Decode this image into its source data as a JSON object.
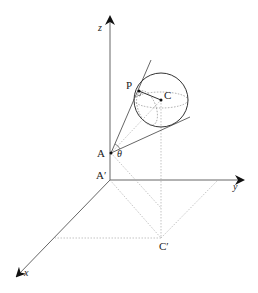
{
  "diagram": {
    "axes": {
      "x": "x",
      "y": "y",
      "z": "z"
    },
    "points": {
      "A": "A",
      "A_prime": "A′",
      "C": "C",
      "C_prime": "C′",
      "P": "P"
    },
    "angle": "θ"
  }
}
